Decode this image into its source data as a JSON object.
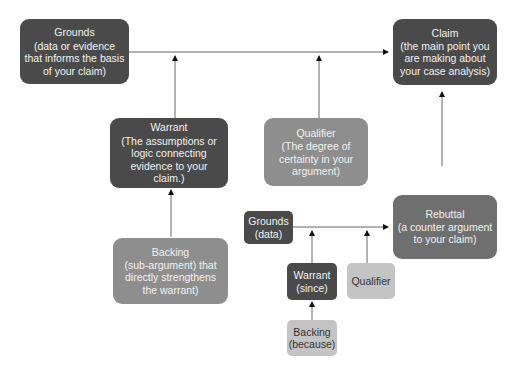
{
  "diagram": {
    "nodes": {
      "grounds": {
        "title": "Grounds",
        "text": "(data or evidence that informs the basis of your claim)"
      },
      "claim": {
        "title": "Claim",
        "text": "(the main point you are making about your case analysis)"
      },
      "warrant": {
        "title": "Warrant",
        "text": "(The assumptions or logic connecting evidence to your claim.)"
      },
      "qualifier": {
        "title": "Qualifier",
        "text": "(The degree of certainty in your argument)"
      },
      "backing": {
        "title": "Backing",
        "text": "(sub-argument) that directly strengthens the warrant)"
      },
      "rebuttal": {
        "title": "Rebuttal",
        "text": "(a counter argument to your claim)"
      },
      "sub_grounds": {
        "title": "Grounds",
        "text": "(data)"
      },
      "sub_warrant": {
        "title": "Warrant",
        "text": "(since)"
      },
      "sub_qualifier": {
        "title": "Qualifier",
        "text": ""
      },
      "sub_backing": {
        "title": "Backing",
        "text": "(because)"
      }
    },
    "colors": {
      "dark": "#4a4a4a",
      "mid": "#6f6f6f",
      "light": "#8e8e8e",
      "pale": "#c4c4c4",
      "line": "#555555"
    }
  }
}
